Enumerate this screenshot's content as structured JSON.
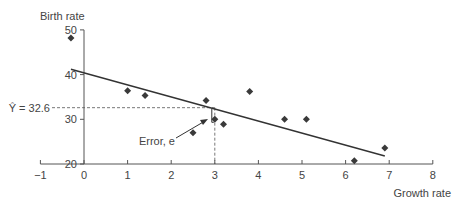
{
  "chart_data": {
    "type": "scatter",
    "title": "",
    "xlabel": "Growth rate",
    "ylabel": "Birth rate",
    "xlim": [
      -1,
      8
    ],
    "ylim": [
      20,
      50
    ],
    "xticks": [
      -1,
      0,
      1,
      2,
      3,
      4,
      5,
      6,
      7,
      8
    ],
    "yticks": [
      20,
      30,
      40,
      50
    ],
    "grid": false,
    "points": [
      {
        "x": -0.3,
        "y": 48.2
      },
      {
        "x": 1.0,
        "y": 36.4
      },
      {
        "x": 1.4,
        "y": 35.3
      },
      {
        "x": 2.5,
        "y": 27.0
      },
      {
        "x": 2.8,
        "y": 34.2
      },
      {
        "x": 3.0,
        "y": 30.0
      },
      {
        "x": 3.2,
        "y": 28.9
      },
      {
        "x": 3.8,
        "y": 36.2
      },
      {
        "x": 4.6,
        "y": 30.0
      },
      {
        "x": 5.1,
        "y": 30.0
      },
      {
        "x": 6.2,
        "y": 20.7
      },
      {
        "x": 6.9,
        "y": 23.6
      }
    ],
    "regression_line": {
      "x1": -0.3,
      "y1": 41.2,
      "x2": 6.9,
      "y2": 21.8
    },
    "annotations": {
      "yhat_label": "Ŷ = 32.6",
      "yhat_value": 32.6,
      "yhat_x": 3.0,
      "error_label": "Error, e"
    }
  },
  "colors": {
    "axis": "#555555",
    "marker": "#3a3a3a",
    "line": "#333333",
    "dashed": "#555555"
  }
}
